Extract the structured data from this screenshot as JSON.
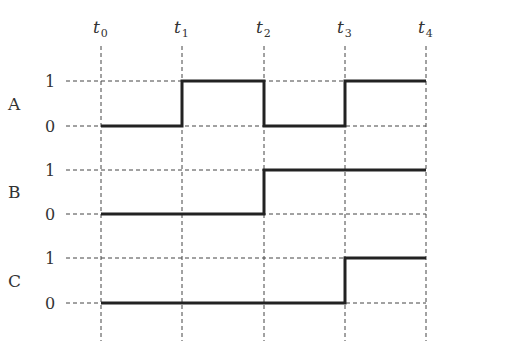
{
  "diagram": {
    "type": "timing-diagram",
    "time_labels": [
      {
        "base": "t",
        "sub": "0"
      },
      {
        "base": "t",
        "sub": "1"
      },
      {
        "base": "t",
        "sub": "2"
      },
      {
        "base": "t",
        "sub": "3"
      },
      {
        "base": "t",
        "sub": "4"
      }
    ],
    "signals": [
      {
        "name": "A",
        "high_label": "1",
        "low_label": "0",
        "levels": [
          0,
          1,
          0,
          1
        ]
      },
      {
        "name": "B",
        "high_label": "1",
        "low_label": "0",
        "levels": [
          0,
          0,
          1,
          1
        ]
      },
      {
        "name": "C",
        "high_label": "1",
        "low_label": "0",
        "levels": [
          0,
          0,
          0,
          1
        ]
      }
    ],
    "colors": {
      "waveform": "#222222",
      "grid": "#444444",
      "text": "#333333"
    }
  }
}
